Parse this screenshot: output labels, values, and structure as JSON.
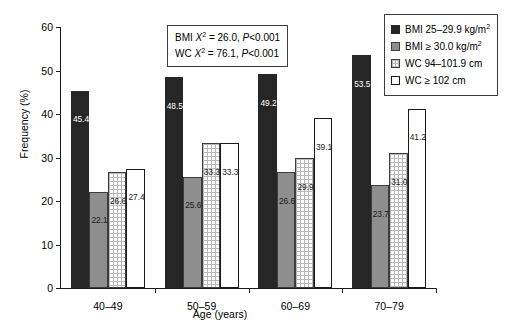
{
  "chart_data": {
    "type": "bar",
    "title": "",
    "xlabel": "Age (years)",
    "ylabel": "Frequency (%)",
    "categories": [
      "40–49",
      "50–59",
      "60–69",
      "70–79"
    ],
    "ylim": [
      0,
      60
    ],
    "yticks": [
      0,
      10,
      20,
      30,
      40,
      50,
      60
    ],
    "grid": false,
    "legend_position": "top-right",
    "series": [
      {
        "name": "BMI 25–29.9 kg/m2",
        "values": [
          45.4,
          48.5,
          49.2,
          53.5
        ]
      },
      {
        "name": "BMI ≥ 30.0 kg/m2",
        "values": [
          22.1,
          25.6,
          26.6,
          23.7
        ]
      },
      {
        "name": "WC 94–101.9 cm",
        "values": [
          26.6,
          33.3,
          29.9,
          31.0
        ]
      },
      {
        "name": "WC ≥ 102 cm",
        "values": [
          27.4,
          33.3,
          39.1,
          41.2
        ]
      }
    ],
    "annotations": [
      "BMI X2 = 26.0, P<0.001",
      "WC X2 = 76.1, P<0.001"
    ]
  },
  "legend": {
    "entries": [
      {
        "prefix": "BMI 25–29.9 kg/m",
        "sup": "2"
      },
      {
        "prefix": "BMI ≥ 30.0 kg/m",
        "sup": "2"
      },
      {
        "prefix": "WC 94–101.9 cm",
        "sup": ""
      },
      {
        "prefix": "WC ≥ 102 cm",
        "sup": ""
      }
    ]
  },
  "stats": {
    "line1": {
      "lead": "BMI ",
      "sym": "X",
      "sup": "2",
      "rest": " = 26.0, ",
      "p": "P",
      "pval": "<0.001"
    },
    "line2": {
      "lead": "WC ",
      "sym": "X",
      "sup": "2",
      "rest": " = 76.1, ",
      "p": "P",
      "pval": "<0.001"
    }
  }
}
